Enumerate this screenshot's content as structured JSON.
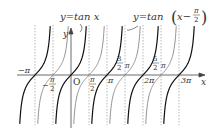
{
  "chart_data": {
    "type": "line",
    "title": "",
    "xlabel": "x",
    "ylabel": "y",
    "origin_label": "O",
    "grid": false,
    "series": [
      {
        "name": "y=tan x",
        "label": "y=tan x",
        "style": "bold black",
        "zeros": [
          "-π",
          "0",
          "π",
          "2π",
          "3π"
        ],
        "asymptotes": [
          "-3π/2",
          "-π/2",
          "π/2",
          "3π/2",
          "5π/2",
          "7π/2"
        ]
      },
      {
        "name": "y=tan(x-π/2)",
        "label": "y=tan(x−π/2)",
        "style": "thin gray",
        "zeros": [
          "-π/2",
          "π/2",
          "3π/2",
          "5π/2"
        ],
        "asymptotes": [
          "-π",
          "0",
          "π",
          "2π",
          "3π"
        ]
      }
    ],
    "x_tick_labels": [
      "-π",
      "-π/2",
      "O",
      "π/2",
      "π",
      "3/2 π",
      "2π",
      "5/2 π",
      "3π"
    ],
    "xlim": [
      "-π",
      "3π"
    ],
    "dashed_asymptote_lines_at": [
      "-π",
      "-π/2",
      "π/2",
      "π",
      "3π/2",
      "2π",
      "5π/2",
      "3π"
    ]
  },
  "labels": {
    "tanx": "y=tan x",
    "shift_prefix": "y=tan",
    "shift_x": "x−",
    "pi": "π",
    "two": "2",
    "three": "3",
    "five": "5",
    "neg_pi": "−π",
    "neg": "−",
    "origin": "O",
    "x_axis": "x",
    "y_axis": "y",
    "two_pi": "2π",
    "three_pi": "3π"
  }
}
